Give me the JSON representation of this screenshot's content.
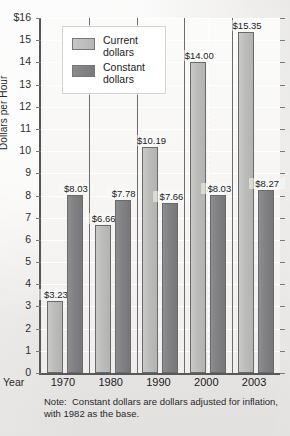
{
  "chart_data": {
    "type": "bar",
    "title": "",
    "xlabel": "Year",
    "ylabel": "Dollars per Hour",
    "ylim": [
      0,
      16
    ],
    "grid": true,
    "legend_position": "top-left-inside",
    "categories": [
      "1970",
      "1980",
      "1990",
      "2000",
      "2003"
    ],
    "series": [
      {
        "name": "Current dollars",
        "color": "#bcbcba",
        "values": [
          3.23,
          6.66,
          10.19,
          14.0,
          15.35
        ],
        "labels": [
          "$3.23",
          "$6.66",
          "$10.19",
          "$14.00",
          "$15.35"
        ]
      },
      {
        "name": "Constant dollars",
        "color": "#818183",
        "values": [
          8.03,
          7.78,
          7.66,
          8.03,
          8.27
        ],
        "labels": [
          "$8.03",
          "$7.78",
          "$7.66",
          "$8.03",
          "$8.27"
        ]
      }
    ],
    "ytick_labels": [
      "$16",
      "15",
      "14",
      "13",
      "12",
      "11",
      "10",
      "9",
      "8",
      "7",
      "6",
      "5",
      "4",
      "3",
      "2",
      "1",
      "0"
    ],
    "ytick_values": [
      16,
      15,
      14,
      13,
      12,
      11,
      10,
      9,
      8,
      7,
      6,
      5,
      4,
      3,
      2,
      1,
      0
    ],
    "annotations": [
      "Note:  Constant dollars are dollars adjusted for inflation, with 1982 as the base."
    ]
  },
  "legend": {
    "items": [
      {
        "label_line1": "Current",
        "label_line2": "dollars"
      },
      {
        "label_line1": "Constant",
        "label_line2": "dollars"
      }
    ]
  },
  "note": {
    "lead": "Note:  ",
    "line1": "Constant dollars are dollars adjusted for inflation,",
    "line2": "with 1982 as the base."
  },
  "axis": {
    "x_title": "Year",
    "y_title": "Dollars per Hour"
  },
  "colors": {
    "current_bar": "#bcbcba",
    "constant_bar": "#818183",
    "axis": "#58585a",
    "gridline": "#ffffff",
    "text": "#1c1c1e",
    "plot_background": "#f6f5f3",
    "page_background": "#f2f1ef"
  }
}
